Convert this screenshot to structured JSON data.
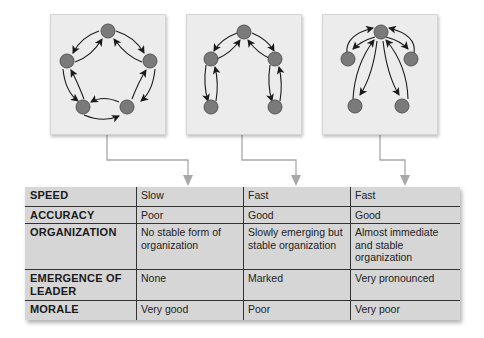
{
  "colors": {
    "panel_bg": "#ececec",
    "node_fill": "#7a7a7a",
    "node_stroke": "#555555",
    "edge": "#1a1a1a",
    "connector": "#a8a8a8",
    "table_bg": "#d6d6d6",
    "table_rule": "#333333"
  },
  "diagrams": [
    {
      "name": "circle-network",
      "layout": "circle"
    },
    {
      "name": "chain-network",
      "layout": "chain"
    },
    {
      "name": "wheel-network",
      "layout": "wheel"
    }
  ],
  "table": {
    "columns": [
      "",
      "Circle",
      "Chain",
      "Wheel"
    ],
    "rows": [
      {
        "label": "SPEED",
        "values": [
          "Slow",
          "Fast",
          "Fast"
        ]
      },
      {
        "label": "ACCURACY",
        "values": [
          "Poor",
          "Good",
          "Good"
        ]
      },
      {
        "label": "ORGANIZATION",
        "values": [
          "No stable form of organization",
          "Slowly emerging but stable organization",
          "Almost immediate and stable organization"
        ]
      },
      {
        "label": "EMERGENCE OF LEADER",
        "values": [
          "None",
          "Marked",
          "Very pronounced"
        ]
      },
      {
        "label": "MORALE",
        "values": [
          "Very good",
          "Poor",
          "Very poor"
        ]
      }
    ]
  }
}
